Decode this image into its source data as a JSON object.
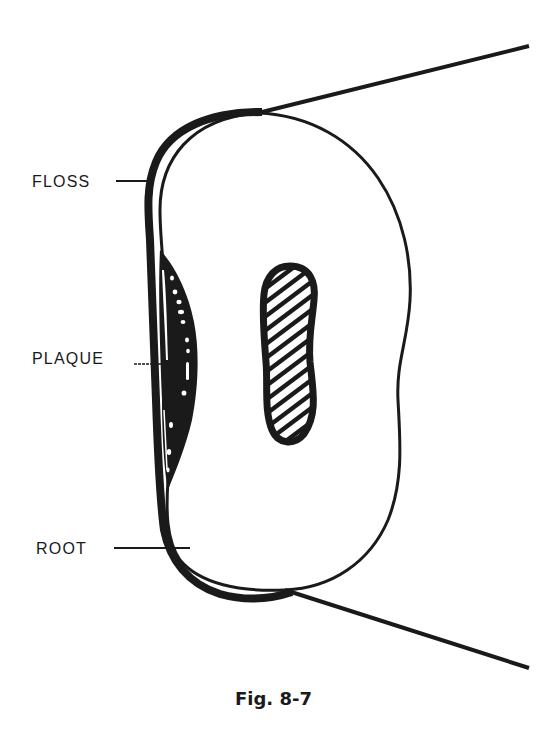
{
  "figure": {
    "caption": "Fig. 8-7",
    "labels": {
      "floss": "FLOSS",
      "plaque": "PLAQUE",
      "root": "ROOT"
    }
  },
  "colors": {
    "ink": "#1a1a1a",
    "background": "#ffffff"
  }
}
